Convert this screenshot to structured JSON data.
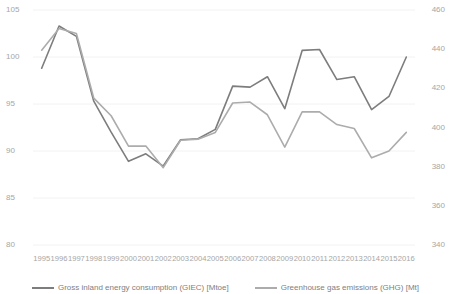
{
  "chart_data": {
    "type": "line",
    "title": "",
    "subtitle": "",
    "xlabel": "",
    "ylabel": "",
    "grid": true,
    "legend_position": "bottom",
    "categories": [
      "1995",
      "1996",
      "1997",
      "1998",
      "1999",
      "2000",
      "2001",
      "2002",
      "2003",
      "2004",
      "2005",
      "2006",
      "2007",
      "2008",
      "2009",
      "2010",
      "2011",
      "2012",
      "2013",
      "2014",
      "2015",
      "2016"
    ],
    "axes": {
      "left": {
        "label": "",
        "ticks": [
          80,
          85,
          90,
          95,
          100,
          105
        ],
        "ylim": [
          80,
          105
        ],
        "series": "Gross inland energy consumption (GIEC) [Mtoe]"
      },
      "right": {
        "label": "",
        "ticks": [
          340,
          360,
          380,
          400,
          420,
          440,
          460
        ],
        "ylim": [
          340,
          460
        ],
        "series": "Greenhouse gas emissions (GHG) [Mt]"
      }
    },
    "series": [
      {
        "name": "Gross inland energy consumption (GIEC) [Mtoe]",
        "axis": "left",
        "unit": "Mtoe",
        "color": "#7d7d7d",
        "values": [
          98.8,
          103.3,
          102.2,
          95.3,
          92.0,
          88.9,
          89.7,
          88.4,
          91.2,
          91.3,
          92.3,
          96.9,
          96.8,
          97.9,
          94.5,
          100.7,
          100.8,
          97.6,
          97.9,
          94.4,
          95.8,
          100.0
        ]
      },
      {
        "name": "Greenhouse gas emissions (GHG) [Mt]",
        "axis": "right",
        "unit": "Mt",
        "color": "#acacac",
        "values": [
          439.5,
          450.5,
          448.0,
          415.0,
          406.0,
          390.5,
          390.5,
          379.5,
          393.5,
          394.0,
          397.5,
          412.5,
          413.0,
          406.5,
          390.0,
          408.0,
          408.0,
          401.5,
          399.5,
          384.5,
          388.0,
          397.5
        ]
      }
    ]
  },
  "legend": {
    "items": [
      {
        "label": "Gross inland energy consumption (GIEC) [Mtoe]",
        "color": "#7d7d7d"
      },
      {
        "label": "Greenhouse gas emissions (GHG) [Mt]",
        "color": "#acacac"
      }
    ]
  }
}
